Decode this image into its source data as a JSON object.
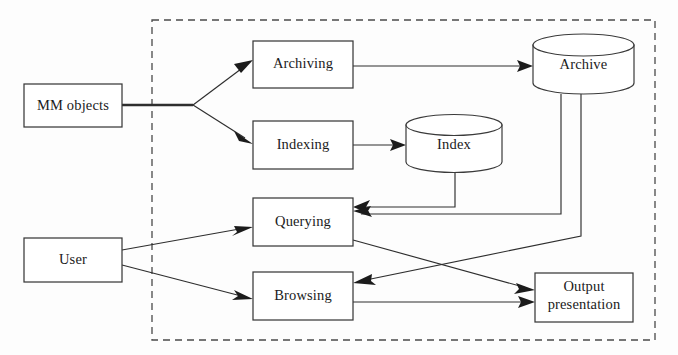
{
  "diagram": {
    "colors": {
      "stroke": "#3a3a3a",
      "edge": "#2e2e2e",
      "boundary": "#4a4a4a",
      "background": "#fdfdfd",
      "text": "#1b1b1b"
    },
    "boundary": {
      "name": "system-boundary",
      "style": "dashed",
      "x": 152,
      "y": 20,
      "width": 503,
      "height": 320
    },
    "nodes": [
      {
        "id": "mm-objects",
        "label": "MM objects",
        "shape": "rectangle",
        "x": 24,
        "y": 84,
        "width": 98,
        "height": 43,
        "inside_boundary": false
      },
      {
        "id": "user",
        "label": "User",
        "shape": "rectangle",
        "x": 24,
        "y": 238,
        "width": 98,
        "height": 44,
        "inside_boundary": false
      },
      {
        "id": "archiving",
        "label": "Archiving",
        "shape": "rectangle",
        "x": 253,
        "y": 41,
        "width": 100,
        "height": 47,
        "inside_boundary": true
      },
      {
        "id": "indexing",
        "label": "Indexing",
        "shape": "rectangle",
        "x": 253,
        "y": 121,
        "width": 100,
        "height": 48,
        "inside_boundary": true
      },
      {
        "id": "querying",
        "label": "Querying",
        "shape": "rectangle",
        "x": 253,
        "y": 198,
        "width": 100,
        "height": 48,
        "inside_boundary": true
      },
      {
        "id": "browsing",
        "label": "Browsing",
        "shape": "rectangle",
        "x": 253,
        "y": 272,
        "width": 100,
        "height": 48,
        "inside_boundary": true
      },
      {
        "id": "archive",
        "label": "Archive",
        "shape": "cylinder",
        "x": 533,
        "y": 34,
        "width": 101,
        "height": 60,
        "inside_boundary": true
      },
      {
        "id": "index",
        "label": "Index",
        "shape": "cylinder",
        "x": 406,
        "y": 114,
        "width": 96,
        "height": 59,
        "inside_boundary": true
      },
      {
        "id": "output-presentation",
        "label": "Output presentation",
        "label_line1": "Output",
        "label_line2": "presentation",
        "shape": "rectangle",
        "x": 535,
        "y": 273,
        "width": 98,
        "height": 49,
        "inside_boundary": true
      }
    ],
    "edges": [
      {
        "id": "mm-to-archiving",
        "from": "mm-objects",
        "to": "archiving",
        "arrow": true
      },
      {
        "id": "mm-to-indexing",
        "from": "mm-objects",
        "to": "indexing",
        "arrow": true
      },
      {
        "id": "archiving-to-archive",
        "from": "archiving",
        "to": "archive",
        "arrow": true
      },
      {
        "id": "indexing-to-index",
        "from": "indexing",
        "to": "index",
        "arrow": true
      },
      {
        "id": "index-to-querying",
        "from": "index",
        "to": "querying",
        "arrow": true
      },
      {
        "id": "archive-to-querying",
        "from": "archive",
        "to": "querying",
        "arrow": true
      },
      {
        "id": "archive-to-browsing",
        "from": "archive",
        "to": "browsing",
        "arrow": true
      },
      {
        "id": "user-to-querying",
        "from": "user",
        "to": "querying",
        "arrow": true
      },
      {
        "id": "user-to-browsing",
        "from": "user",
        "to": "browsing",
        "arrow": true
      },
      {
        "id": "querying-to-output",
        "from": "querying",
        "to": "output-presentation",
        "arrow": true
      },
      {
        "id": "browsing-to-output",
        "from": "browsing",
        "to": "output-presentation",
        "arrow": true
      }
    ]
  }
}
